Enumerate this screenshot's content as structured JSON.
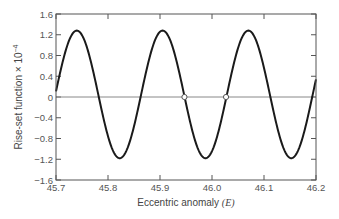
{
  "chart_data": {
    "type": "line",
    "title": "",
    "xlabel": "Eccentric anomaly (E)",
    "xlabel_text": "Eccentric anomaly ",
    "xlabel_symbol": "(E)",
    "ylabel": "Rise-set function × 10^-4",
    "ylabel_text": "Rise-set function × 10",
    "ylabel_exponent": "−4",
    "xlim": [
      45.7,
      46.2
    ],
    "ylim": [
      -1.6,
      1.6
    ],
    "xticks": [
      45.7,
      45.8,
      45.9,
      46.0,
      46.1,
      46.2
    ],
    "xtick_labels": [
      "45.7",
      "45.8",
      "45.9",
      "46.0",
      "46.1",
      "46.2"
    ],
    "yticks": [
      1.6,
      1.2,
      0.8,
      0.4,
      0,
      -0.4,
      -0.8,
      -1.2,
      -1.6
    ],
    "ytick_labels": [
      "1.6",
      "1.2",
      "0.8",
      "0.4",
      "0",
      "−0.4",
      "−0.8",
      "−1.2",
      "−1.6"
    ],
    "grid": false,
    "zero_line": true,
    "legend": null,
    "series": [
      {
        "name": "Rise-set function",
        "model": {
          "amplitude": 1.23,
          "offset": 0.05,
          "period": 0.165,
          "peak_x": 45.74
        },
        "x": [
          45.7,
          45.74,
          45.78,
          45.825,
          45.865,
          45.905,
          45.947,
          45.99,
          46.027,
          46.07,
          46.11,
          46.155,
          46.2
        ],
        "y": [
          0.4,
          1.28,
          0.0,
          -1.18,
          0.0,
          1.28,
          0.0,
          -1.18,
          0.0,
          1.28,
          0.0,
          -1.18,
          0.0
        ]
      }
    ],
    "markers": [
      {
        "x": 45.947,
        "y": 0,
        "style": "open-circle",
        "label": "root"
      },
      {
        "x": 46.027,
        "y": 0,
        "style": "open-circle",
        "label": "root"
      }
    ],
    "colors": {
      "curve": "#1a1a1a",
      "axes": "#555555",
      "zero_line": "#888888",
      "marker_fill": "#ffffff"
    }
  },
  "layout": {
    "plot": {
      "left": 56,
      "top": 14,
      "right": 316,
      "bottom": 180
    }
  }
}
